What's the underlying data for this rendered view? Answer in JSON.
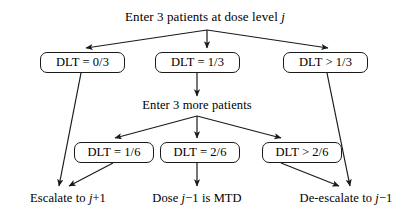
{
  "diagram": {
    "title": "Enter 3 patients at dose level j",
    "title_prefix": "Enter 3 patients at dose level",
    "title_var": "j",
    "midstep": "Enter 3 more patients",
    "stroke_color": "#1a1a1a",
    "background_color": "#ffffff",
    "text_color": "#000000"
  },
  "cohort1": {
    "box_left": "DLT = 0/3",
    "box_mid": "DLT = 1/3",
    "box_right": "DLT > 1/3"
  },
  "cohort2": {
    "box_left": "DLT = 1/6",
    "box_mid": "DLT = 2/6",
    "box_right": "DLT > 2/6"
  },
  "outcomes": {
    "escalate_prefix": "Escalate to",
    "escalate_var": "j",
    "escalate_suffix": "+1",
    "mtd_prefix": "Dose",
    "mtd_var": "j",
    "mtd_suffix": "−1 is MTD",
    "deescalate_prefix": "De-escalate to",
    "deescalate_var": "j",
    "deescalate_suffix": "−1"
  }
}
